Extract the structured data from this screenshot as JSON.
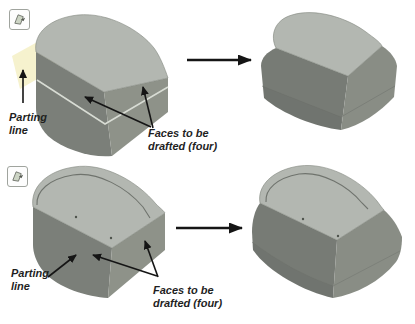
{
  "figure": {
    "row1": {
      "icon": "draft-feature-icon",
      "parting_line_label": "Parting\nline",
      "faces_label": "Faces to be\ndrafted (four)"
    },
    "row2": {
      "icon": "draft-feature-icon",
      "parting_line_label": "Parting\nline",
      "faces_label": "Faces to be\ndrafted (four)"
    }
  },
  "colors": {
    "background": "#ffffff",
    "top_face": "#b3b7b1",
    "front_face": "#7b7f79",
    "side_face": "#8e9289",
    "front_face_drafted": "#777b75",
    "side_face_drafted": "#898d85",
    "parting_line_light": "#d8dcd4",
    "parting_line_dark": "#6f736d",
    "parting_plane": "#f4f0c6",
    "annotation_arrow": "#151515",
    "label_text": "#1f1f1f",
    "icon_border": "#a0a49e",
    "icon_face": "#ccd4c4"
  }
}
